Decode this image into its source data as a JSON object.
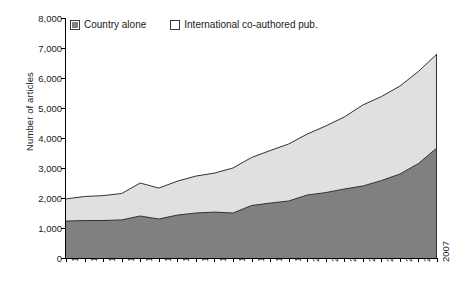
{
  "chart_data": {
    "type": "area",
    "stacked": true,
    "title": "",
    "xlabel": "",
    "ylabel": "Number of articles",
    "ylim": [
      0,
      8000
    ],
    "ytick_labels": [
      "0",
      "1,000",
      "2,000",
      "3,000",
      "4,000",
      "5,000",
      "6,000",
      "7,000",
      "8,000"
    ],
    "ytick_values": [
      0,
      1000,
      2000,
      3000,
      4000,
      5000,
      6000,
      7000,
      8000
    ],
    "grid": false,
    "legend_position": "top-left",
    "categories": [
      "1987",
      "1988",
      "1989",
      "1990",
      "1991",
      "1992",
      "1993",
      "1994",
      "1995",
      "1996",
      "1997",
      "1998",
      "1999",
      "2000",
      "2001",
      "2002",
      "2003",
      "2004",
      "2005",
      "2006",
      "2007"
    ],
    "series": [
      {
        "name": "Country alone",
        "color": "#808080",
        "values": [
          1230,
          1250,
          1250,
          1270,
          1400,
          1300,
          1430,
          1500,
          1530,
          1500,
          1750,
          1830,
          1900,
          2100,
          2180,
          2300,
          2400,
          2580,
          2800,
          3150,
          3670
        ]
      },
      {
        "name": "International co-authored pub.",
        "color": "#e0e0e0",
        "values": [
          740,
          800,
          830,
          880,
          1100,
          1030,
          1130,
          1230,
          1300,
          1500,
          1600,
          1750,
          1900,
          2030,
          2220,
          2400,
          2700,
          2800,
          2930,
          3070,
          3130
        ]
      }
    ],
    "totals": [
      1970,
      2050,
      2080,
      2150,
      2500,
      2330,
      2560,
      2730,
      2830,
      3000,
      3350,
      3580,
      3800,
      4130,
      4400,
      4700,
      5100,
      5380,
      5730,
      6220,
      6800
    ]
  },
  "legend": {
    "items": [
      {
        "label": "Country alone",
        "swatch": "dark"
      },
      {
        "label": "International co-authored pub.",
        "swatch": "light"
      }
    ]
  },
  "axis": {
    "y_title": "Number of articles"
  }
}
